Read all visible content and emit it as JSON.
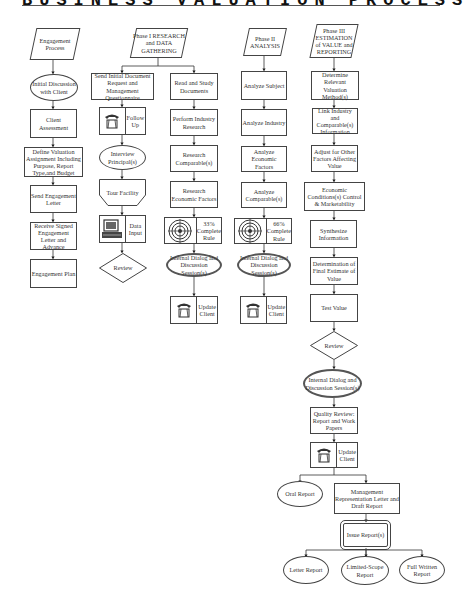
{
  "title": "BUSINESS VALUATION PROCESS CHART",
  "columns": {
    "engagement": {
      "header": "Engagement Process",
      "steps": [
        "Initial Discussion with Client",
        "Client Assessment",
        "Define Valuation Assignment Including Purpose, Report Type,and Budget",
        "Send Engagement Letter",
        "Receive Signed Engagement Letter and Advance",
        "Engagement Plan"
      ]
    },
    "phase1": {
      "header": "Phase I RESEARCH and DATA GATHERING",
      "left": [
        "Send Initial Document Request and Management Questionnaire",
        "Follow Up",
        "Interview Principal(s)",
        "Tour Facility",
        "Data Input",
        "Review"
      ],
      "right": [
        "Read and Study Documents",
        "Perform Industry Research",
        "Research Comparable(s)",
        "Research Economic Factors",
        "33% Complete Rule",
        "Internal Dialog and Discussion Session(s)",
        "Update Client"
      ]
    },
    "phase2": {
      "header": "Phase II ANALYSIS",
      "steps": [
        "Analyze Subject",
        "Analyze Industry",
        "Analyze Economic Factors",
        "Analyze Comparable(s)",
        "66% Complete Rule",
        "Internal Dialog and Discussion Session(s)",
        "Update Client"
      ]
    },
    "phase3": {
      "header": "Phase III ESTIMATION of VALUE and REPORTING",
      "steps": [
        "Determine Relevant Valuation Method(s)",
        "Link Industry and Comparable(s) Information",
        "Adjust for Other Factors Affecting Value",
        "Economic Conditions(s) Control & Marketability",
        "Synthesize Information",
        "Determination of Final Estimate of Value",
        "Test Value",
        "Review",
        "Internal Dialog and Discussion Session(s)",
        "Quality Review: Report and Work Papers",
        "Update Client"
      ],
      "branch": {
        "oral": "Oral Report",
        "draft": "Management Representation Letter and Draft Report",
        "issue": "Issue Report(s)",
        "reports": [
          "Letter Report",
          "Limited-Scope Report",
          "Full Written Report"
        ]
      }
    }
  },
  "icons": {
    "telephone": "telephone-icon",
    "computer": "computer-icon",
    "target": "target-icon"
  }
}
